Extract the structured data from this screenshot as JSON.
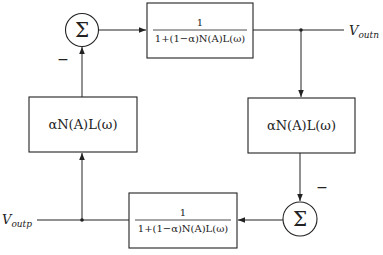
{
  "diagram": {
    "type": "block-diagram",
    "nodes": {
      "sum_top": {
        "symbol": "Σ",
        "sign_label": "−"
      },
      "sum_bottom": {
        "symbol": "Σ",
        "sign_label": "−"
      },
      "forward_top": {
        "numerator": "1",
        "denominator": "1+(1−α)N(A)L(ω)"
      },
      "forward_bottom": {
        "numerator": "1",
        "denominator": "1+(1−α)N(A)L(ω)"
      },
      "feedback_left": {
        "label": "αN(A)L(ω)"
      },
      "feedback_right": {
        "label": "αN(A)L(ω)"
      }
    },
    "ports": {
      "output_n": {
        "main": "V",
        "sub": "outn"
      },
      "output_p": {
        "main": "V",
        "sub": "outp"
      }
    },
    "edges": [
      {
        "from": "sum_top",
        "to": "forward_top"
      },
      {
        "from": "forward_top",
        "to": "output_n"
      },
      {
        "from": "output_n",
        "to": "feedback_right"
      },
      {
        "from": "feedback_right",
        "to": "sum_bottom",
        "sign": "−"
      },
      {
        "from": "sum_bottom",
        "to": "forward_bottom"
      },
      {
        "from": "forward_bottom",
        "to": "output_p"
      },
      {
        "from": "output_p",
        "to": "feedback_left"
      },
      {
        "from": "feedback_left",
        "to": "sum_top",
        "sign": "−"
      }
    ]
  }
}
